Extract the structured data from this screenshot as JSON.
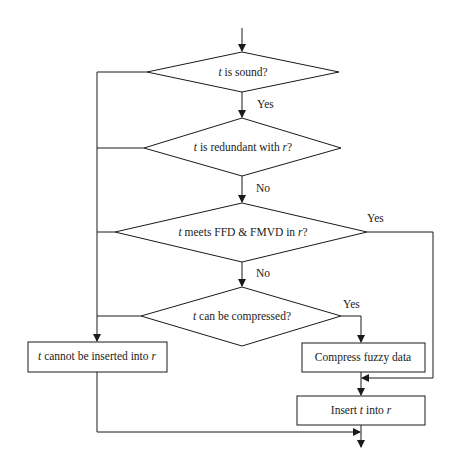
{
  "diagram": {
    "type": "flowchart",
    "stroke_color": "#1a1a1a",
    "background": "#ffffff",
    "decisions": [
      {
        "id": "sound",
        "var": "t",
        "text": " is sound?",
        "suffix": ""
      },
      {
        "id": "redundant",
        "var": "t",
        "text": " is redundant with ",
        "suffix_var": "r",
        "suffix": "?"
      },
      {
        "id": "meets",
        "var": "t",
        "text": " meets FFD & FMVD in ",
        "suffix_var": "r",
        "suffix": "?"
      },
      {
        "id": "compress_check",
        "var": "t",
        "text": " can be compressed?",
        "suffix": ""
      }
    ],
    "processes": [
      {
        "id": "reject",
        "var": "t",
        "text": " cannot be inserted into ",
        "suffix_var": "r"
      },
      {
        "id": "compress",
        "text": "Compress fuzzy data"
      },
      {
        "id": "insert",
        "prefix": "Insert ",
        "var": "t",
        "text": " into ",
        "suffix_var": "r"
      }
    ],
    "edge_labels": {
      "sound_yes": "Yes",
      "redundant_no": "No",
      "meets_yes": "Yes",
      "meets_no": "No",
      "compress_yes": "Yes"
    }
  }
}
